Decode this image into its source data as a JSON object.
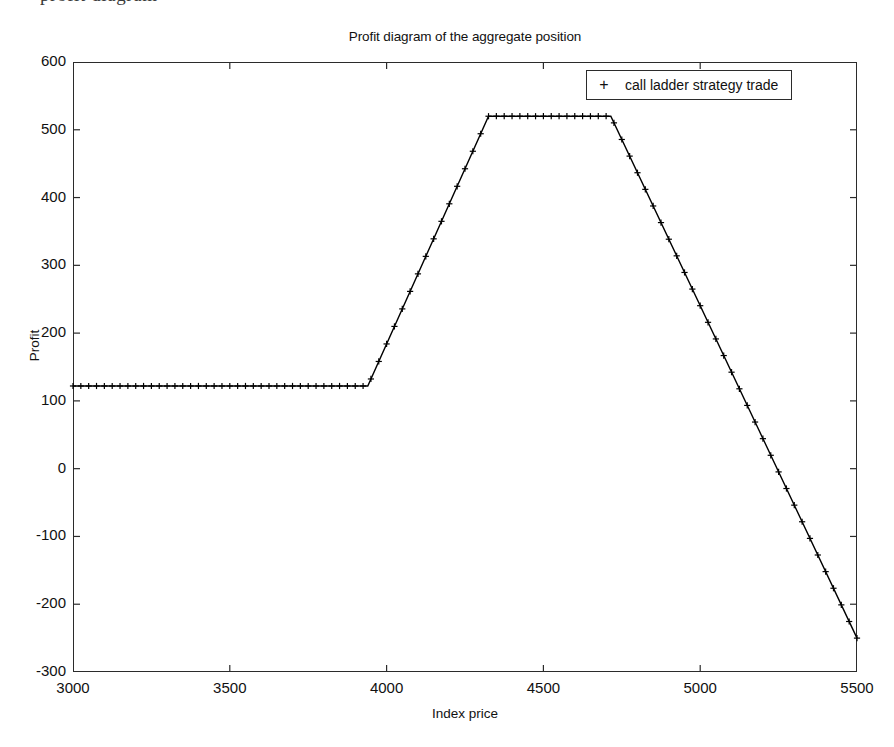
{
  "page_bleed_text": "profit diagram",
  "chart_data": {
    "type": "line",
    "title": "Profit diagram of the aggregate position",
    "xlabel": "Index price",
    "ylabel": "Profit",
    "xlim": [
      3000,
      5500
    ],
    "ylim": [
      -300,
      600
    ],
    "xticks": [
      3000,
      3500,
      4000,
      4500,
      5000,
      5500
    ],
    "yticks": [
      -300,
      -200,
      -100,
      0,
      100,
      200,
      300,
      400,
      500,
      600
    ],
    "grid": false,
    "marker": "+",
    "line_color": "#000000",
    "legend": {
      "position": "top-right",
      "entries": [
        {
          "label": "call ladder strategy trade",
          "marker": "+"
        }
      ]
    },
    "series": [
      {
        "name": "call ladder strategy trade",
        "breakpoints": [
          {
            "x": 3000,
            "y": 122
          },
          {
            "x": 3940,
            "y": 122
          },
          {
            "x": 4325,
            "y": 520
          },
          {
            "x": 4715,
            "y": 520
          },
          {
            "x": 5500,
            "y": -250
          }
        ],
        "x": [
          3000,
          3025,
          3050,
          3075,
          3100,
          3125,
          3150,
          3175,
          3200,
          3225,
          3250,
          3275,
          3300,
          3325,
          3350,
          3375,
          3400,
          3425,
          3450,
          3475,
          3500,
          3525,
          3550,
          3575,
          3600,
          3625,
          3650,
          3675,
          3700,
          3725,
          3750,
          3775,
          3800,
          3825,
          3850,
          3875,
          3900,
          3925,
          3950,
          3975,
          4000,
          4025,
          4050,
          4075,
          4100,
          4125,
          4150,
          4175,
          4200,
          4225,
          4250,
          4275,
          4300,
          4325,
          4350,
          4375,
          4400,
          4425,
          4450,
          4475,
          4500,
          4525,
          4550,
          4575,
          4600,
          4625,
          4650,
          4675,
          4700,
          4725,
          4750,
          4775,
          4800,
          4825,
          4850,
          4875,
          4900,
          4925,
          4950,
          4975,
          5000,
          5025,
          5050,
          5075,
          5100,
          5125,
          5150,
          5175,
          5200,
          5225,
          5250,
          5275,
          5300,
          5325,
          5350,
          5375,
          5400,
          5425,
          5450,
          5475,
          5500
        ],
        "y": [
          122,
          122,
          122,
          122,
          122,
          122,
          122,
          122,
          122,
          122,
          122,
          122,
          122,
          122,
          122,
          122,
          122,
          122,
          122,
          122,
          122,
          122,
          122,
          122,
          122,
          122,
          122,
          122,
          122,
          122,
          122,
          122,
          122,
          122,
          122,
          122,
          122,
          122,
          132,
          158,
          184,
          210,
          236,
          261,
          287,
          313,
          339,
          365,
          391,
          417,
          442,
          468,
          494,
          520,
          520,
          520,
          520,
          520,
          520,
          520,
          520,
          520,
          520,
          520,
          520,
          520,
          520,
          520,
          520,
          510,
          486,
          461,
          437,
          412,
          388,
          363,
          339,
          314,
          290,
          265,
          241,
          216,
          192,
          167,
          143,
          118,
          94,
          69,
          45,
          20,
          -4,
          -29,
          -53,
          -78,
          -102,
          -127,
          -151,
          -176,
          -200,
          -225,
          -250
        ]
      }
    ]
  }
}
